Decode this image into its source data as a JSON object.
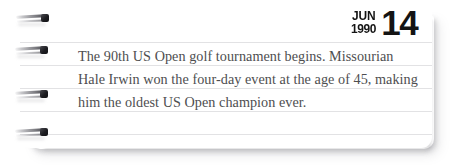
{
  "card": {
    "type": "spiral-notebook-page",
    "background_color": "#ffffff",
    "page_color": "#ffffff",
    "rule_line_color": "#e2e2e4",
    "rule_line_count": 5
  },
  "date": {
    "month": "JUN",
    "year": "1990",
    "day": "14",
    "color": "#141414"
  },
  "note": {
    "text": "The 90th US Open golf tournament begins. Missourian Hale Irwin won the four-day event at the age of 45, making him the oldest US Open champion ever.",
    "lines": [
      "The 90th US Open golf tournament begins.",
      "Missourian Hale Irwin won the four-day event at the",
      "age of 45, making him the oldest US Open champion",
      "ever."
    ],
    "color": "#4e4e50"
  },
  "binding": {
    "ring_count": 4,
    "ring_label": "spiral-binding-ring"
  }
}
